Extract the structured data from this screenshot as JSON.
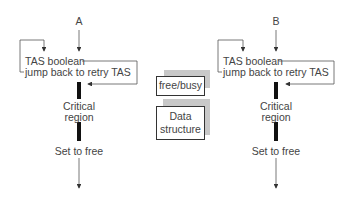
{
  "process_a": {
    "label": "A",
    "tas_line1": "TAS boolean",
    "tas_line2": "jump back to retry TAS",
    "critical_line1": "Critical",
    "critical_line2": "region",
    "set_free": "Set to free"
  },
  "process_b": {
    "label": "B",
    "tas_line1": "TAS boolean",
    "tas_line2": "jump back to retry TAS",
    "critical_line1": "Critical",
    "critical_line2": "region",
    "set_free": "Set to free"
  },
  "shared": {
    "flag_label": "free/busy",
    "data_line1": "Data",
    "data_line2": "structure"
  },
  "colors": {
    "line": "#555555",
    "bar": "#111111",
    "shadow": "#c8c8c8",
    "text": "#444444"
  }
}
